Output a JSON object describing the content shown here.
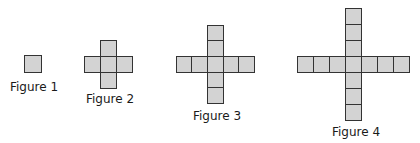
{
  "style": {
    "fill": "#d3d3d3",
    "stroke": "#333333",
    "background": "#ffffff"
  },
  "figures": [
    {
      "label": "Figure 1",
      "arm_length": 0,
      "cell": 17,
      "center_x": 24,
      "center_y": 55,
      "label_x": 10,
      "label_y": 81
    },
    {
      "label": "Figure 2",
      "arm_length": 1,
      "cell": 16,
      "center_x": 100,
      "center_y": 56,
      "label_x": 86,
      "label_y": 93
    },
    {
      "label": "Figure 3",
      "arm_length": 2,
      "cell": 15.6,
      "center_x": 207,
      "center_y": 56,
      "label_x": 193,
      "label_y": 110
    },
    {
      "label": "Figure 4",
      "arm_length": 3,
      "cell": 16,
      "center_x": 345,
      "center_y": 56,
      "label_x": 332,
      "label_y": 126
    }
  ]
}
